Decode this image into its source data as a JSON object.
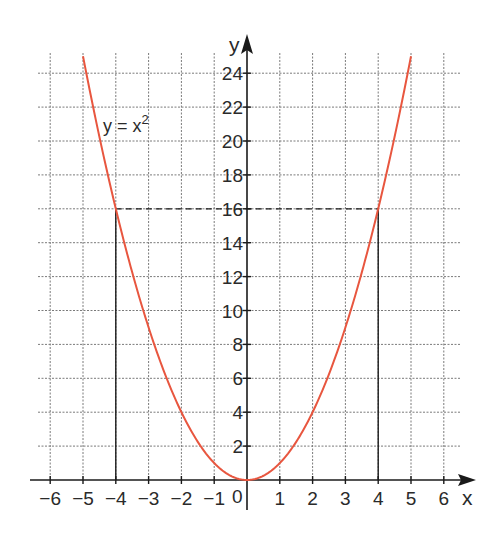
{
  "chart_data": {
    "type": "line",
    "title": "",
    "function_label": "y = x²",
    "function_label_base": "y = x",
    "function_label_exp": "2",
    "xlabel": "x",
    "ylabel": "y",
    "xlim": [
      -6,
      6
    ],
    "ylim": [
      0,
      25
    ],
    "grid": true,
    "legend": "none",
    "x_ticks": [
      -6,
      -5,
      -4,
      -3,
      -2,
      -1,
      1,
      2,
      3,
      4,
      5,
      6
    ],
    "x_tick_labels": [
      "−6",
      "−5",
      "−4",
      "−3",
      "−2",
      "−1",
      "1",
      "2",
      "3",
      "4",
      "5",
      "6"
    ],
    "origin_label": "0",
    "y_ticks": [
      2,
      4,
      6,
      8,
      10,
      12,
      14,
      16,
      18,
      20,
      22,
      24
    ],
    "y_tick_labels": [
      "2",
      "4",
      "6",
      "8",
      "10",
      "12",
      "14",
      "16",
      "18",
      "20",
      "22",
      "24"
    ],
    "series": [
      {
        "name": "y = x²",
        "color": "#e8563f",
        "x": [
          -5,
          -4,
          -3,
          -2,
          -1,
          0,
          1,
          2,
          3,
          4,
          5
        ],
        "y": [
          25,
          16,
          9,
          4,
          1,
          0,
          1,
          4,
          9,
          16,
          25
        ]
      }
    ],
    "annotations": [
      {
        "type": "dashed-horizontal",
        "y": 16,
        "x_from": -4,
        "x_to": 4
      },
      {
        "type": "solid-vertical",
        "x": -4,
        "y_from": 0,
        "y_to": 16
      },
      {
        "type": "solid-vertical",
        "x": 4,
        "y_from": 0,
        "y_to": 16
      }
    ]
  },
  "layout": {
    "origin_px": [
      247,
      480
    ],
    "unit_x_px": 32.8,
    "unit_y_px": 16.95,
    "grid_x_range_px": [
      38,
      461
    ],
    "grid_top_px": 53
  }
}
